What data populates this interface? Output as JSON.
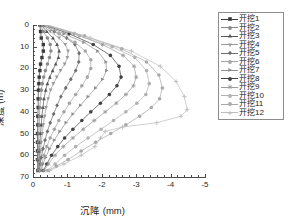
{
  "chart_data": {
    "type": "line",
    "title": "",
    "xlabel": "沉降 (mm)",
    "ylabel": "深度 (m)",
    "xlim": [
      0,
      -5
    ],
    "ylim": [
      0,
      70
    ],
    "xticks": [
      "0",
      "-1",
      "-2",
      "-3",
      "-4",
      "-5"
    ],
    "yticks": [
      "0",
      "10",
      "20",
      "30",
      "40",
      "50",
      "60",
      "70"
    ],
    "grid": false,
    "legend_position": "right",
    "x_axis_inverted": true,
    "y_axis_inverted": true,
    "series": [
      {
        "name": "开挖1",
        "marker": "filled-square",
        "color": "#3a3a3a",
        "points": [
          {
            "s": -0.2,
            "d": 0
          },
          {
            "s": -0.22,
            "d": 3
          },
          {
            "s": -0.24,
            "d": 6
          },
          {
            "s": -0.3,
            "d": 9
          },
          {
            "s": -0.3,
            "d": 12
          },
          {
            "s": -0.26,
            "d": 15
          },
          {
            "s": -0.22,
            "d": 18
          },
          {
            "s": -0.2,
            "d": 21
          },
          {
            "s": -0.18,
            "d": 24
          },
          {
            "s": -0.17,
            "d": 27
          },
          {
            "s": -0.16,
            "d": 30
          },
          {
            "s": -0.15,
            "d": 34
          },
          {
            "s": -0.15,
            "d": 38
          },
          {
            "s": -0.14,
            "d": 42
          },
          {
            "s": -0.14,
            "d": 46
          },
          {
            "s": -0.13,
            "d": 50
          },
          {
            "s": -0.13,
            "d": 54
          },
          {
            "s": -0.13,
            "d": 58
          },
          {
            "s": -0.13,
            "d": 62
          },
          {
            "s": -0.14,
            "d": 67
          }
        ]
      },
      {
        "name": "开挖2",
        "marker": "circle",
        "color": "#8a8a8a",
        "points": [
          {
            "s": -0.22,
            "d": 0
          },
          {
            "s": -0.3,
            "d": 3
          },
          {
            "s": -0.42,
            "d": 6
          },
          {
            "s": -0.5,
            "d": 9
          },
          {
            "s": -0.52,
            "d": 12
          },
          {
            "s": -0.48,
            "d": 15
          },
          {
            "s": -0.42,
            "d": 18
          },
          {
            "s": -0.36,
            "d": 21
          },
          {
            "s": -0.31,
            "d": 24
          },
          {
            "s": -0.27,
            "d": 27
          },
          {
            "s": -0.24,
            "d": 30
          },
          {
            "s": -0.22,
            "d": 34
          },
          {
            "s": -0.2,
            "d": 38
          },
          {
            "s": -0.19,
            "d": 42
          },
          {
            "s": -0.18,
            "d": 46
          },
          {
            "s": -0.17,
            "d": 50
          },
          {
            "s": -0.16,
            "d": 54
          },
          {
            "s": -0.16,
            "d": 58
          },
          {
            "s": -0.15,
            "d": 62
          },
          {
            "s": -0.15,
            "d": 67
          }
        ]
      },
      {
        "name": "开挖3",
        "marker": "triangle-up",
        "color": "#555555",
        "points": [
          {
            "s": -0.24,
            "d": 0
          },
          {
            "s": -0.4,
            "d": 3
          },
          {
            "s": -0.58,
            "d": 6
          },
          {
            "s": -0.7,
            "d": 9
          },
          {
            "s": -0.76,
            "d": 12
          },
          {
            "s": -0.74,
            "d": 15
          },
          {
            "s": -0.66,
            "d": 18
          },
          {
            "s": -0.57,
            "d": 21
          },
          {
            "s": -0.49,
            "d": 24
          },
          {
            "s": -0.42,
            "d": 27
          },
          {
            "s": -0.37,
            "d": 30
          },
          {
            "s": -0.32,
            "d": 34
          },
          {
            "s": -0.29,
            "d": 38
          },
          {
            "s": -0.26,
            "d": 42
          },
          {
            "s": -0.24,
            "d": 46
          },
          {
            "s": -0.22,
            "d": 50
          },
          {
            "s": -0.2,
            "d": 54
          },
          {
            "s": -0.19,
            "d": 58
          },
          {
            "s": -0.18,
            "d": 62
          },
          {
            "s": -0.17,
            "d": 67
          }
        ]
      },
      {
        "name": "开挖4",
        "marker": "triangle-down",
        "color": "#9a9a9a",
        "points": [
          {
            "s": -0.26,
            "d": 0
          },
          {
            "s": -0.5,
            "d": 3
          },
          {
            "s": -0.76,
            "d": 6
          },
          {
            "s": -0.94,
            "d": 9
          },
          {
            "s": -1.02,
            "d": 12
          },
          {
            "s": -1.0,
            "d": 15
          },
          {
            "s": -0.92,
            "d": 18
          },
          {
            "s": -0.8,
            "d": 21
          },
          {
            "s": -0.69,
            "d": 24
          },
          {
            "s": -0.59,
            "d": 27
          },
          {
            "s": -0.51,
            "d": 30
          },
          {
            "s": -0.44,
            "d": 34
          },
          {
            "s": -0.38,
            "d": 38
          },
          {
            "s": -0.34,
            "d": 42
          },
          {
            "s": -0.3,
            "d": 46
          },
          {
            "s": -0.27,
            "d": 50
          },
          {
            "s": -0.24,
            "d": 54
          },
          {
            "s": -0.22,
            "d": 58
          },
          {
            "s": -0.2,
            "d": 62
          },
          {
            "s": -0.19,
            "d": 67
          }
        ]
      },
      {
        "name": "开挖5",
        "marker": "diamond",
        "color": "#6e6e6e",
        "points": [
          {
            "s": -0.28,
            "d": 0
          },
          {
            "s": -0.62,
            "d": 3
          },
          {
            "s": -0.98,
            "d": 6
          },
          {
            "s": -1.22,
            "d": 9
          },
          {
            "s": -1.34,
            "d": 13
          },
          {
            "s": -1.33,
            "d": 17
          },
          {
            "s": -1.24,
            "d": 21
          },
          {
            "s": -1.1,
            "d": 25
          },
          {
            "s": -0.95,
            "d": 29
          },
          {
            "s": -0.81,
            "d": 33
          },
          {
            "s": -0.7,
            "d": 37
          },
          {
            "s": -0.6,
            "d": 41
          },
          {
            "s": -0.5,
            "d": 45
          },
          {
            "s": -0.42,
            "d": 49
          },
          {
            "s": -0.35,
            "d": 53
          },
          {
            "s": -0.29,
            "d": 57
          },
          {
            "s": -0.24,
            "d": 61
          },
          {
            "s": -0.21,
            "d": 64
          },
          {
            "s": -0.19,
            "d": 67
          }
        ]
      },
      {
        "name": "开挖6",
        "marker": "circle",
        "color": "#a5a5a5",
        "points": [
          {
            "s": -0.3,
            "d": 0
          },
          {
            "s": -0.76,
            "d": 4
          },
          {
            "s": -1.22,
            "d": 8
          },
          {
            "s": -1.52,
            "d": 12
          },
          {
            "s": -1.68,
            "d": 16
          },
          {
            "s": -1.68,
            "d": 20
          },
          {
            "s": -1.58,
            "d": 24
          },
          {
            "s": -1.42,
            "d": 28
          },
          {
            "s": -1.24,
            "d": 32
          },
          {
            "s": -1.06,
            "d": 36
          },
          {
            "s": -0.9,
            "d": 40
          },
          {
            "s": -0.75,
            "d": 44
          },
          {
            "s": -0.62,
            "d": 48
          },
          {
            "s": -0.5,
            "d": 52
          },
          {
            "s": -0.4,
            "d": 56
          },
          {
            "s": -0.32,
            "d": 60
          },
          {
            "s": -0.26,
            "d": 64
          },
          {
            "s": -0.22,
            "d": 67
          }
        ]
      },
      {
        "name": "开挖7",
        "marker": "triangle-right",
        "color": "#8f8f8f",
        "points": [
          {
            "s": -0.32,
            "d": 0
          },
          {
            "s": -0.9,
            "d": 4
          },
          {
            "s": -1.48,
            "d": 8
          },
          {
            "s": -1.88,
            "d": 12
          },
          {
            "s": -2.12,
            "d": 17
          },
          {
            "s": -2.14,
            "d": 21
          },
          {
            "s": -2.02,
            "d": 25
          },
          {
            "s": -1.82,
            "d": 29
          },
          {
            "s": -1.6,
            "d": 33
          },
          {
            "s": -1.38,
            "d": 37
          },
          {
            "s": -1.16,
            "d": 41
          },
          {
            "s": -0.96,
            "d": 45
          },
          {
            "s": -0.78,
            "d": 49
          },
          {
            "s": -0.62,
            "d": 53
          },
          {
            "s": -0.48,
            "d": 57
          },
          {
            "s": -0.37,
            "d": 61
          },
          {
            "s": -0.29,
            "d": 64
          },
          {
            "s": -0.24,
            "d": 67
          }
        ]
      },
      {
        "name": "开挖8",
        "marker": "filled-circle",
        "color": "#404040",
        "points": [
          {
            "s": -0.34,
            "d": 0
          },
          {
            "s": -1.05,
            "d": 4
          },
          {
            "s": -1.75,
            "d": 9
          },
          {
            "s": -2.25,
            "d": 14
          },
          {
            "s": -2.5,
            "d": 19
          },
          {
            "s": -2.56,
            "d": 24
          },
          {
            "s": -2.44,
            "d": 28
          },
          {
            "s": -2.22,
            "d": 32
          },
          {
            "s": -1.96,
            "d": 36
          },
          {
            "s": -1.68,
            "d": 40
          },
          {
            "s": -1.42,
            "d": 44
          },
          {
            "s": -1.16,
            "d": 48
          },
          {
            "s": -0.92,
            "d": 52
          },
          {
            "s": -0.72,
            "d": 56
          },
          {
            "s": -0.54,
            "d": 60
          },
          {
            "s": -0.4,
            "d": 64
          },
          {
            "s": -0.3,
            "d": 67
          }
        ]
      },
      {
        "name": "开挖9",
        "marker": "asterisk",
        "color": "#9c9c9c",
        "points": [
          {
            "s": -0.36,
            "d": 0
          },
          {
            "s": -1.2,
            "d": 4
          },
          {
            "s": -2.02,
            "d": 9
          },
          {
            "s": -2.62,
            "d": 14
          },
          {
            "s": -2.94,
            "d": 19
          },
          {
            "s": -3.0,
            "d": 24
          },
          {
            "s": -2.92,
            "d": 28
          },
          {
            "s": -2.7,
            "d": 32
          },
          {
            "s": -2.42,
            "d": 36
          },
          {
            "s": -2.1,
            "d": 40
          },
          {
            "s": -1.78,
            "d": 44
          },
          {
            "s": -1.46,
            "d": 48
          },
          {
            "s": -1.16,
            "d": 52
          },
          {
            "s": -0.88,
            "d": 56
          },
          {
            "s": -0.64,
            "d": 60
          },
          {
            "s": -0.45,
            "d": 64
          },
          {
            "s": -0.32,
            "d": 67
          }
        ]
      },
      {
        "name": "开挖10",
        "marker": "circle",
        "color": "#b0b0b0",
        "points": [
          {
            "s": -0.38,
            "d": 0
          },
          {
            "s": -1.35,
            "d": 5
          },
          {
            "s": -2.3,
            "d": 10
          },
          {
            "s": -2.96,
            "d": 15
          },
          {
            "s": -3.3,
            "d": 21
          },
          {
            "s": -3.38,
            "d": 27
          },
          {
            "s": -3.28,
            "d": 32
          },
          {
            "s": -3.02,
            "d": 36
          },
          {
            "s": -2.7,
            "d": 40
          },
          {
            "s": -2.34,
            "d": 44
          },
          {
            "s": -1.98,
            "d": 48
          },
          {
            "s": -1.6,
            "d": 52
          },
          {
            "s": -1.24,
            "d": 56
          },
          {
            "s": -0.92,
            "d": 60
          },
          {
            "s": -0.64,
            "d": 64
          },
          {
            "s": -0.42,
            "d": 67
          }
        ]
      },
      {
        "name": "开挖11",
        "marker": "circle",
        "color": "#a8a8a8",
        "points": [
          {
            "s": -0.4,
            "d": 0
          },
          {
            "s": -1.5,
            "d": 5
          },
          {
            "s": -2.58,
            "d": 11
          },
          {
            "s": -3.3,
            "d": 17
          },
          {
            "s": -3.66,
            "d": 23
          },
          {
            "s": -3.76,
            "d": 29
          },
          {
            "s": -3.68,
            "d": 34
          },
          {
            "s": -3.44,
            "d": 38
          },
          {
            "s": -3.1,
            "d": 42
          },
          {
            "s": -2.7,
            "d": 46
          },
          {
            "s": -2.26,
            "d": 50
          },
          {
            "s": -1.82,
            "d": 54
          },
          {
            "s": -1.4,
            "d": 58
          },
          {
            "s": -1.02,
            "d": 62
          },
          {
            "s": -0.68,
            "d": 65
          },
          {
            "s": -0.45,
            "d": 67
          }
        ]
      },
      {
        "name": "开挖12",
        "marker": "plus",
        "color": "#bdbdbd",
        "points": [
          {
            "s": -0.42,
            "d": 0
          },
          {
            "s": -1.66,
            "d": 6
          },
          {
            "s": -2.86,
            "d": 12
          },
          {
            "s": -3.7,
            "d": 19
          },
          {
            "s": -4.16,
            "d": 26
          },
          {
            "s": -4.4,
            "d": 33
          },
          {
            "s": -4.48,
            "d": 39
          },
          {
            "s": -4.3,
            "d": 42
          },
          {
            "s": -3.6,
            "d": 45
          },
          {
            "s": -2.6,
            "d": 47
          },
          {
            "s": -2.1,
            "d": 49
          },
          {
            "s": -1.96,
            "d": 52
          },
          {
            "s": -1.8,
            "d": 56
          },
          {
            "s": -1.4,
            "d": 60
          },
          {
            "s": -0.9,
            "d": 64
          },
          {
            "s": -0.48,
            "d": 67
          }
        ]
      }
    ]
  }
}
